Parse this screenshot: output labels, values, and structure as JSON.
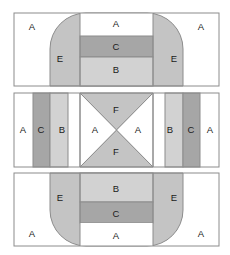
{
  "figure": {
    "background_color": "#ffffff",
    "stroke_color": "#8c8c8c",
    "label_color": "#1a1a1a"
  },
  "palette": {
    "panel_a_white": "#ffffff",
    "panel_b_light_gray": "#d2d2d2",
    "panel_c_dark_gray": "#a6a6a6",
    "panel_e_mid_gray": "#c4c4c4",
    "panel_f_mid_gray": "#c4c4c4"
  },
  "panels": [
    {
      "id": "top-panel",
      "name": "top",
      "x": 14,
      "y": 13,
      "width": 205,
      "height": 73,
      "dividers_x": [
        80,
        153
      ],
      "regions": [
        {
          "code": "A",
          "role": "left-flap",
          "label": "A",
          "label_x": 32,
          "label_y": 27,
          "fill": "panel_a_white"
        },
        {
          "code": "A",
          "role": "top-center-flap",
          "label": "A",
          "label_x": 116,
          "label_y": 24,
          "fill": "panel_a_white"
        },
        {
          "code": "A",
          "role": "right-flap",
          "label": "A",
          "label_x": 201,
          "label_y": 27,
          "fill": "panel_a_white"
        },
        {
          "code": "E",
          "role": "left-rounded-end",
          "label": "E",
          "label_x": 60,
          "label_y": 59,
          "fill": "panel_e_mid_gray"
        },
        {
          "code": "E",
          "role": "right-rounded-end",
          "label": "E",
          "label_x": 174,
          "label_y": 59,
          "fill": "panel_e_mid_gray"
        },
        {
          "code": "C",
          "role": "center-dark-band",
          "label": "C",
          "label_x": 116,
          "label_y": 47,
          "fill": "panel_c_dark_gray"
        },
        {
          "code": "B",
          "role": "center-light-band",
          "label": "B",
          "label_x": 116,
          "label_y": 70,
          "fill": "panel_b_light_gray"
        }
      ]
    },
    {
      "id": "middle-panel",
      "name": "middle",
      "x": 14,
      "y": 93,
      "width": 205,
      "height": 74,
      "dividers_x": [
        80,
        153
      ],
      "regions": [
        {
          "code": "A",
          "role": "far-left-flap",
          "label": "A",
          "label_x": 23,
          "label_y": 130,
          "fill": "panel_a_white"
        },
        {
          "code": "C",
          "role": "left-dark-band",
          "label": "C",
          "label_x": 41,
          "label_y": 130,
          "fill": "panel_c_dark_gray"
        },
        {
          "code": "B",
          "role": "left-light-band",
          "label": "B",
          "label_x": 62,
          "label_y": 130,
          "fill": "panel_b_light_gray"
        },
        {
          "code": "A",
          "role": "left-cross-triangle",
          "label": "A",
          "label_x": 95,
          "label_y": 130,
          "fill": "panel_a_white"
        },
        {
          "code": "F",
          "role": "top-cross-triangle",
          "label": "F",
          "label_x": 116,
          "label_y": 110,
          "fill": "panel_f_mid_gray"
        },
        {
          "code": "F",
          "role": "bottom-cross-triangle",
          "label": "F",
          "label_x": 116,
          "label_y": 152,
          "fill": "panel_f_mid_gray"
        },
        {
          "code": "A",
          "role": "right-cross-triangle",
          "label": "A",
          "label_x": 138,
          "label_y": 130,
          "fill": "panel_a_white"
        },
        {
          "code": "B",
          "role": "right-light-band",
          "label": "B",
          "label_x": 170,
          "label_y": 130,
          "fill": "panel_b_light_gray"
        },
        {
          "code": "C",
          "role": "right-dark-band",
          "label": "C",
          "label_x": 191,
          "label_y": 130,
          "fill": "panel_c_dark_gray"
        },
        {
          "code": "A",
          "role": "far-right-flap",
          "label": "A",
          "label_x": 210,
          "label_y": 130,
          "fill": "panel_a_white"
        }
      ]
    },
    {
      "id": "bottom-panel",
      "name": "bottom",
      "x": 14,
      "y": 173,
      "width": 205,
      "height": 73,
      "dividers_x": [
        80,
        153
      ],
      "regions": [
        {
          "code": "E",
          "role": "left-rounded-end",
          "label": "E",
          "label_x": 60,
          "label_y": 198,
          "fill": "panel_e_mid_gray"
        },
        {
          "code": "E",
          "role": "right-rounded-end",
          "label": "E",
          "label_x": 174,
          "label_y": 198,
          "fill": "panel_e_mid_gray"
        },
        {
          "code": "B",
          "role": "center-light-band",
          "label": "B",
          "label_x": 116,
          "label_y": 189,
          "fill": "panel_b_light_gray"
        },
        {
          "code": "C",
          "role": "center-dark-band",
          "label": "C",
          "label_x": 116,
          "label_y": 214,
          "fill": "panel_c_dark_gray"
        },
        {
          "code": "A",
          "role": "left-flap",
          "label": "A",
          "label_x": 32,
          "label_y": 234,
          "fill": "panel_a_white"
        },
        {
          "code": "A",
          "role": "bottom-center-flap",
          "label": "A",
          "label_x": 116,
          "label_y": 236,
          "fill": "panel_a_white"
        },
        {
          "code": "A",
          "role": "right-flap",
          "label": "A",
          "label_x": 201,
          "label_y": 234,
          "fill": "panel_a_white"
        }
      ]
    }
  ],
  "geometry": {
    "left_edge": 14,
    "right_edge": 219,
    "divider_left": 80,
    "divider_right": 153,
    "top_panel_top": 13,
    "top_panel_bottom": 86,
    "mid_panel_top": 93,
    "mid_panel_bottom": 167,
    "bot_panel_top": 173,
    "bot_panel_bottom": 246,
    "corner_radius": 36,
    "band_c_top_y": 36,
    "band_c_bottom_y": 57,
    "mid_col_x1": 33,
    "mid_col_x2": 50,
    "mid_col_x3": 68,
    "mid_col_x4": 165,
    "mid_col_x5": 183,
    "mid_col_x6": 200
  }
}
